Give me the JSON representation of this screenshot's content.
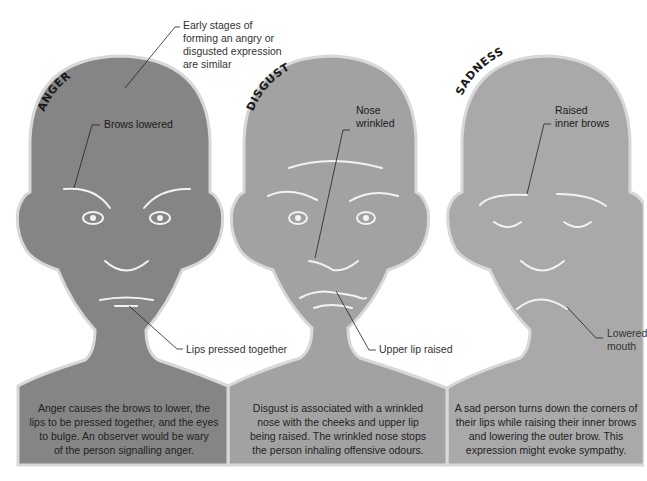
{
  "figure": {
    "colors": {
      "anger_face": "#858585",
      "disgust_face": "#a2a2a2",
      "sadness_face": "#a9a9a9",
      "outline": "#d8d8d8",
      "feature_lines": "#f2f2f2",
      "leader_lines": "#222222",
      "background": "#ffffff"
    },
    "panels": [
      {
        "title": "ANGER",
        "callouts": [
          "Brows lowered",
          "Lips pressed together"
        ],
        "description": [
          "Anger causes the brows to lower, the",
          "lips to be pressed together, and the eyes",
          "to bulge. An observer would be wary",
          "of the person signalling anger."
        ]
      },
      {
        "title": "DISGUST",
        "callouts": [
          "Nose",
          "wrinkled",
          "Upper lip raised"
        ],
        "description": [
          "Disgust is associated with a wrinkled",
          "nose with the cheeks and upper lip",
          "being raised. The wrinkled nose stops",
          "the person inhaling offensive odours."
        ]
      },
      {
        "title": "SADNESS",
        "callouts": [
          "Raised",
          "inner brows",
          "Lowered",
          "mouth"
        ],
        "description": [
          "A sad person turns down the corners of",
          "their lips while raising their inner brows",
          "and lowering the outer brow. This",
          "expression might evoke sympathy."
        ]
      }
    ],
    "shared_callout": [
      "Early stages of",
      "forming an angry or",
      "disgusted expression",
      "are similar"
    ]
  }
}
